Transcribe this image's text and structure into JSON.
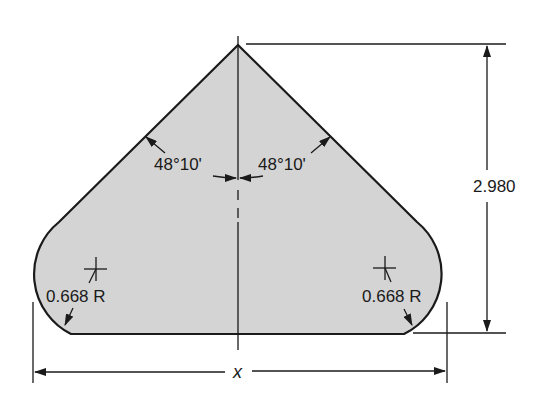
{
  "diagram": {
    "type": "engineering-drawing",
    "shape": "pointed-top plate with rounded bottom corners",
    "fill_color": "#d4d4d4",
    "stroke_color": "#1a1a1a",
    "labels": {
      "angle_left": "48°10'",
      "angle_right": "48°10'",
      "height": "2.980",
      "radius_left": "0.668 R",
      "radius_right": "0.668 R",
      "width": "x"
    }
  }
}
